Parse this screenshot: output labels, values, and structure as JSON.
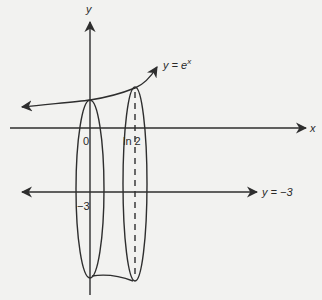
{
  "diagram": {
    "axes": {
      "x_label": "x",
      "y_label": "y"
    },
    "curve": {
      "label": "y = e",
      "exponent": "x",
      "equation": "y = e^x"
    },
    "line": {
      "label": "y = −3",
      "equation": "y = -3"
    },
    "ticks": {
      "origin": "0",
      "ln2": "ln 2",
      "neg3": "−3"
    },
    "colors": {
      "background": "#f2f2f0",
      "ink": "#2e2e2e"
    }
  }
}
